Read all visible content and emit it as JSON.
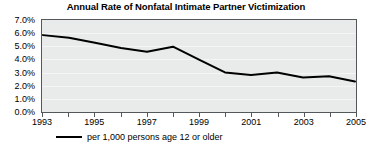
{
  "chart_data": {
    "type": "line",
    "title": "Annual Rate of Nonfatal Intimate Partner Victimization",
    "xlabel": "",
    "ylabel": "",
    "grid": true,
    "legend_position": "bottom-left",
    "ylim": [
      0.0,
      7.0
    ],
    "xlim": [
      1993,
      2005
    ],
    "ytick_labels": [
      "7.0%",
      "6.0%",
      "5.0%",
      "4.0%",
      "3.0%",
      "2.0%",
      "1.0%",
      "0.0%"
    ],
    "ytick_values": [
      7.0,
      6.0,
      5.0,
      4.0,
      3.0,
      2.0,
      1.0,
      0.0
    ],
    "xtick_values": [
      1993,
      1994,
      1995,
      1996,
      1997,
      1998,
      1999,
      2000,
      2001,
      2002,
      2003,
      2004,
      2005
    ],
    "xtick_labels": [
      "1993",
      "",
      "1995",
      "",
      "1997",
      "",
      "1999",
      "",
      "2001",
      "",
      "2003",
      "",
      "2005"
    ],
    "x": [
      1993,
      1994,
      1995,
      1996,
      1997,
      1998,
      1999,
      2000,
      2001,
      2002,
      2003,
      2004,
      2005
    ],
    "series": [
      {
        "name": "per 1,000 persons age 12 or older",
        "color": "#000000",
        "values": [
          5.9,
          5.7,
          5.3,
          4.9,
          4.6,
          5.0,
          4.0,
          3.0,
          2.8,
          3.0,
          2.6,
          2.7,
          2.3
        ]
      }
    ]
  },
  "legend": {
    "entries": [
      {
        "label": "per 1,000 persons age 12 or older",
        "color": "#000000"
      }
    ]
  },
  "colors": {
    "plot_background": "#e9ebeb",
    "gridline": "#f4f6f6",
    "axis": "#55585a",
    "series_line": "#000000",
    "page_background": "#ffffff"
  }
}
